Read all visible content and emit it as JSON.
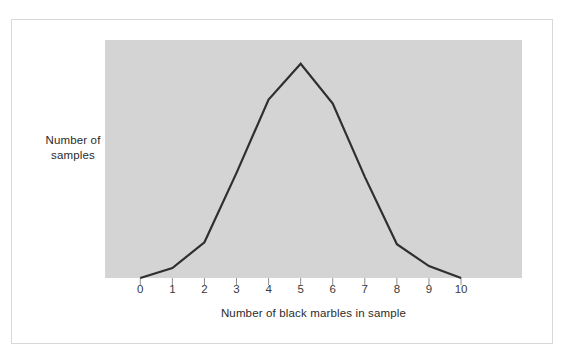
{
  "figure": {
    "background_color": "#ffffff",
    "frame_border_color": "#d8d8d8",
    "plot_background_color": "#d4d4d4",
    "line_color": "#2f2f2f",
    "text_color": "#2b2b2b"
  },
  "chart_data": {
    "type": "line",
    "title": "",
    "xlabel": "Number of black marbles in sample",
    "ylabel": "Number of samples",
    "x": [
      0,
      1,
      2,
      3,
      4,
      5,
      6,
      7,
      8,
      9,
      10
    ],
    "tick_labels": [
      "0",
      "1",
      "2",
      "3",
      "4",
      "5",
      "6",
      "7",
      "8",
      "9",
      "10"
    ],
    "values": [
      0,
      5,
      18,
      53,
      90,
      108,
      88,
      51,
      17,
      6,
      0
    ],
    "series": [
      {
        "name": "Number of samples",
        "values": [
          0,
          5,
          18,
          53,
          90,
          108,
          88,
          51,
          17,
          6,
          0
        ]
      }
    ],
    "xlim": [
      -1.1,
      11.9
    ],
    "ylim": [
      0,
      120
    ],
    "grid": false,
    "legend": false,
    "y_ticks_shown": false,
    "x_ticks_shown": true,
    "shape_description": "symmetric bell-shaped sampling distribution peaking at 5"
  },
  "labels": {
    "y_axis_line1": "Number of",
    "y_axis_line2": "samples",
    "x_axis_title": "Number of black marbles in sample"
  }
}
